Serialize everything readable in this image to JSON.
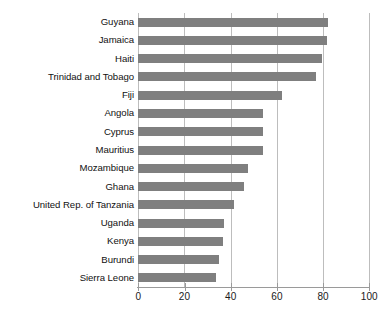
{
  "chart_data": {
    "type": "bar",
    "orientation": "horizontal",
    "title": "",
    "subtitle": "",
    "xlabel": "",
    "ylabel": "",
    "xlim": [
      0,
      100
    ],
    "xticks": [
      0,
      20,
      40,
      60,
      80,
      100
    ],
    "xtick_labels": [
      "0",
      "20",
      "40",
      "60",
      "80",
      "100"
    ],
    "grid": "vertical",
    "legend": "none",
    "bar_color": "#7f7f7f",
    "axis_color": "#9a9a9a",
    "gridline_color": "#bdbdbd",
    "categories": [
      "Guyana",
      "Jamaica",
      "Haiti",
      "Trinidad and Tobago",
      "Fiji",
      "Angola",
      "Cyprus",
      "Mauritius",
      "Mozambique",
      "Ghana",
      "United Rep. of Tanzania",
      "Uganda",
      "Kenya",
      "Burundi",
      "Sierra Leone"
    ],
    "values": [
      82.1,
      81.5,
      79.4,
      77.0,
      62.3,
      54.0,
      54.0,
      54.0,
      47.3,
      45.9,
      41.6,
      37.1,
      36.8,
      35.1,
      33.6
    ]
  }
}
